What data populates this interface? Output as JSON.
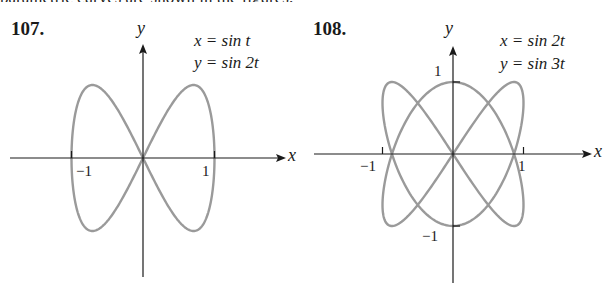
{
  "header": {
    "partial_text": "parametric curves are shown in the figures."
  },
  "problems": [
    {
      "number": "107.",
      "eq_x": "x = sin t",
      "eq_y": "y = sin 2t",
      "x_axis_label": "x",
      "y_axis_label": "y",
      "tick_labels": {
        "x_neg": "−1",
        "x_pos": "1"
      }
    },
    {
      "number": "108.",
      "eq_x": "x = sin 2t",
      "eq_y": "y = sin 3t",
      "x_axis_label": "x",
      "y_axis_label": "y",
      "tick_labels": {
        "x_neg": "−1",
        "x_pos": "1",
        "y_pos": "1",
        "y_neg": "−1"
      }
    }
  ],
  "colors": {
    "curve": "#9a9a9a",
    "axis": "#1a1a1a"
  },
  "chart_data": [
    {
      "type": "line",
      "title": "107. Parametric curve",
      "x_equation": "x = sin t",
      "y_equation": "y = sin 2t",
      "parameter_range": [
        0,
        6.2832
      ],
      "xlabel": "x",
      "ylabel": "y",
      "xlim": [
        -1.85,
        2.0
      ],
      "ylim": [
        -1.65,
        1.55
      ],
      "x_ticks": [
        -1,
        1
      ],
      "y_ticks": [],
      "grid": false,
      "legend": "none",
      "shape": "figure-eight (lemniscate-like), crossing at origin, max |y| = 1 at x = ±0.707"
    },
    {
      "type": "line",
      "title": "108. Parametric curve",
      "x_equation": "x = sin 2t",
      "y_equation": "y = sin 3t",
      "parameter_range": [
        0,
        6.2832
      ],
      "xlabel": "x",
      "ylabel": "y",
      "xlim": [
        -1.9,
        2.0
      ],
      "ylim": [
        -1.8,
        1.55
      ],
      "x_ticks": [
        -1,
        1
      ],
      "y_ticks": [
        -1,
        1
      ],
      "grid": false,
      "legend": "none",
      "shape": "Lissajous curve (2:3), self-intersections on x-axis at x = 0, ±0.866"
    }
  ]
}
